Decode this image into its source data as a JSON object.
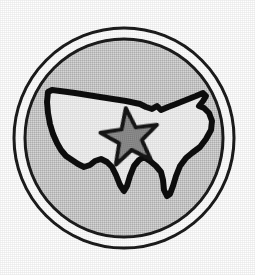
{
  "image": {
    "title": "United States Map Emblem",
    "description": "Circular badge containing a silhouette map of the contiguous United States with a five-pointed star over the central region",
    "width": 255,
    "height": 275,
    "background_color": "#ffffff"
  },
  "colors": {
    "page_background": "#ffffff",
    "outer_ring_stroke": "#1a1a1a",
    "ring_gap_fill": "#ffffff",
    "disc_fill": "#c9c9c9",
    "disc_stroke": "#1a1a1a",
    "map_fill": "#f1f1f1",
    "map_stroke": "#111111",
    "star_fill": "#8a8a8a",
    "star_stroke": "#121212"
  },
  "geometry": {
    "circle_center_x": 124,
    "circle_center_y": 138,
    "outer_ring_radius": 110,
    "outer_ring_stroke_width": 3,
    "disc_radius": 99,
    "disc_stroke_width": 3,
    "star_center_x": 130,
    "star_center_y": 138,
    "star_outer_radius": 30,
    "star_inner_radius": 12,
    "star_rotation_degrees": -8,
    "star_points": 5,
    "map_stroke_width": 6
  },
  "shapes": {
    "outer_ring": {
      "name": "outer-ring",
      "kind": "circle",
      "label": "Outer thin ring"
    },
    "disc": {
      "name": "inner-disc",
      "kind": "circle",
      "label": "Gray inner disc"
    },
    "map": {
      "name": "usa-map",
      "kind": "path",
      "label": "Contiguous United States outline",
      "path": "M 48 92 L 52 90 L 60 91 L 75 93 L 100 97 L 126 101 L 140 104 L 146 107 L 152 109 L 157 106 L 161 110 L 168 107 L 176 104 L 186 100 L 196 96 L 203 93 L 206 96 L 203 101 L 199 106 L 204 108 L 209 113 L 212 121 L 211 130 L 206 139 L 200 147 L 192 153 L 186 158 L 180 166 L 176 176 L 173 186 L 170 194 L 167 196 L 164 190 L 163 180 L 161 172 L 156 166 L 150 161 L 144 157 L 139 160 L 134 166 L 130 176 L 127 186 L 124 191 L 120 185 L 116 175 L 112 167 L 107 162 L 101 159 L 95 161 L 90 165 L 84 167 L 78 164 L 72 160 L 66 156 L 61 150 L 57 143 L 53 134 L 50 124 L 48 113 L 47 102 Z"
    },
    "star": {
      "name": "center-star",
      "kind": "polygon",
      "label": "Five-pointed star marker"
    }
  },
  "layers": [
    {
      "id": "outer-ring",
      "label": "Outer ring"
    },
    {
      "id": "ring-gap",
      "label": "White ring gap"
    },
    {
      "id": "inner-disc",
      "label": "Gray disc"
    },
    {
      "id": "usa-map",
      "label": "USA map silhouette"
    },
    {
      "id": "center-star",
      "label": "Center star"
    }
  ]
}
